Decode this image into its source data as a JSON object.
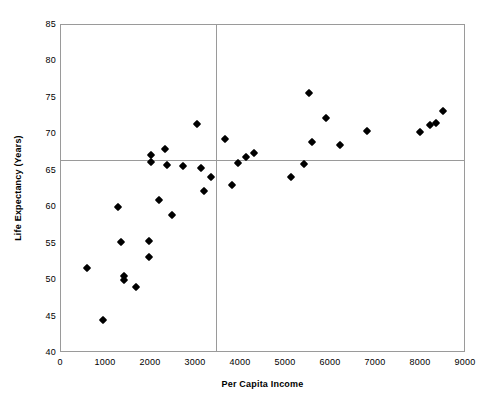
{
  "chart_data": {
    "type": "scatter",
    "title": "",
    "xlabel": "Per Capita Income",
    "ylabel": "Life Expectancy (Years)",
    "xlim": [
      0,
      9000
    ],
    "ylim": [
      40,
      85
    ],
    "xticks": [
      "0",
      "1000",
      "2000",
      "3000",
      "4000",
      "5000",
      "6000",
      "7000",
      "8000",
      "9000"
    ],
    "xtick_values": [
      0,
      1000,
      2000,
      3000,
      4000,
      5000,
      6000,
      7000,
      8000,
      9000
    ],
    "yticks": [
      "40",
      "45",
      "50",
      "55",
      "60",
      "65",
      "70",
      "75",
      "80",
      "85"
    ],
    "ytick_values": [
      40,
      45,
      50,
      55,
      60,
      65,
      70,
      75,
      80,
      85
    ],
    "grid": false,
    "legend": null,
    "marker": "diamond",
    "marker_color": "#000000",
    "frame_color": "#9a9a9a",
    "reference_lines": {
      "horizontal_value": 66.5,
      "vertical_value": 3450,
      "color": "#9a9a9a"
    },
    "points": [
      {
        "x": 580,
        "y": 51.7
      },
      {
        "x": 930,
        "y": 44.5
      },
      {
        "x": 1270,
        "y": 60.0
      },
      {
        "x": 1330,
        "y": 55.2
      },
      {
        "x": 1390,
        "y": 50.6
      },
      {
        "x": 1400,
        "y": 50.0
      },
      {
        "x": 1660,
        "y": 49.0
      },
      {
        "x": 1950,
        "y": 55.4
      },
      {
        "x": 1960,
        "y": 53.2
      },
      {
        "x": 2000,
        "y": 67.1
      },
      {
        "x": 2010,
        "y": 66.2
      },
      {
        "x": 2170,
        "y": 61.0
      },
      {
        "x": 2300,
        "y": 68.0
      },
      {
        "x": 2350,
        "y": 65.8
      },
      {
        "x": 2470,
        "y": 59.0
      },
      {
        "x": 2700,
        "y": 65.7
      },
      {
        "x": 3030,
        "y": 71.4
      },
      {
        "x": 3120,
        "y": 65.4
      },
      {
        "x": 3180,
        "y": 62.2
      },
      {
        "x": 3330,
        "y": 64.2
      },
      {
        "x": 3640,
        "y": 69.3
      },
      {
        "x": 3800,
        "y": 63.0
      },
      {
        "x": 3930,
        "y": 66.0
      },
      {
        "x": 4120,
        "y": 66.9
      },
      {
        "x": 4280,
        "y": 67.5
      },
      {
        "x": 5110,
        "y": 64.2
      },
      {
        "x": 5400,
        "y": 65.9
      },
      {
        "x": 5510,
        "y": 75.7
      },
      {
        "x": 5570,
        "y": 68.9
      },
      {
        "x": 5880,
        "y": 72.2
      },
      {
        "x": 6210,
        "y": 68.6
      },
      {
        "x": 6800,
        "y": 70.4
      },
      {
        "x": 7980,
        "y": 70.3
      },
      {
        "x": 8210,
        "y": 71.3
      },
      {
        "x": 8330,
        "y": 71.5
      },
      {
        "x": 8490,
        "y": 73.2
      }
    ]
  }
}
